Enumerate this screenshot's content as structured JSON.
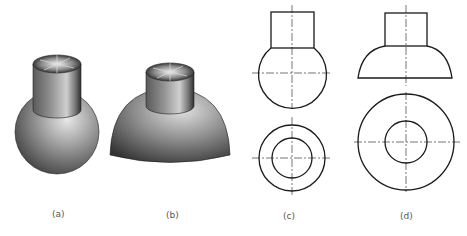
{
  "figure": {
    "panels": [
      {
        "id": "a",
        "label": "(a)",
        "description": "cylinder on sphere, shaded 3D"
      },
      {
        "id": "b",
        "label": "(b)",
        "description": "cylinder on hemisphere dome, shaded 3D"
      },
      {
        "id": "c",
        "label": "(c)",
        "description": "orthographic views: front view (cylinder on sphere) and top view (two concentric circles)"
      },
      {
        "id": "d",
        "label": "(d)",
        "description": "orthographic views: front view (cylinder on dome) and top view (two concentric circles)"
      }
    ],
    "colors": {
      "line": "#1a1a1a",
      "background": "#ffffff"
    }
  }
}
